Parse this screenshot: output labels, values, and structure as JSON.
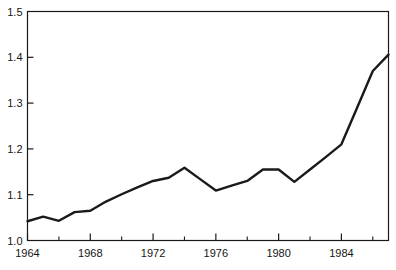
{
  "chart_data": {
    "type": "line",
    "title": "",
    "subtitle": "",
    "xlabel": "",
    "ylabel": "",
    "xlim": [
      1964,
      1987
    ],
    "ylim": [
      1.0,
      1.5
    ],
    "grid": false,
    "legend": false,
    "legend_position": "none",
    "x_major_ticks": [
      1964,
      1968,
      1972,
      1976,
      1980,
      1984
    ],
    "x_minor_ticks": [
      1966,
      1970,
      1974,
      1978,
      1982,
      1986
    ],
    "x_tick_labels": [
      "1964",
      "1968",
      "1972",
      "1976",
      "1980",
      "1984"
    ],
    "y_ticks": [
      1.0,
      1.1,
      1.2,
      1.3,
      1.4,
      1.5
    ],
    "y_tick_labels": [
      "1.0",
      "1.1",
      "1.2",
      "1.3",
      "1.4",
      "1.5"
    ],
    "line_color": "#1a1a1a",
    "line_width": 2.4,
    "frame_color": "#1a1a1a",
    "background_color": "#ffffff",
    "x": [
      1964,
      1965,
      1966,
      1967,
      1968,
      1969,
      1970,
      1971,
      1972,
      1973,
      1974,
      1975,
      1976,
      1977,
      1978,
      1979,
      1980,
      1981,
      1982,
      1983,
      1984,
      1985,
      1986,
      1987
    ],
    "values": [
      1.042,
      1.052,
      1.043,
      1.062,
      1.065,
      1.085,
      1.101,
      1.116,
      1.13,
      1.137,
      1.159,
      1.134,
      1.109,
      1.12,
      1.13,
      1.155,
      1.155,
      1.128,
      1.155,
      1.182,
      1.21,
      1.29,
      1.37,
      1.406
    ],
    "series": [
      {
        "name": "series-1",
        "values": [
          1.042,
          1.052,
          1.043,
          1.062,
          1.065,
          1.085,
          1.101,
          1.116,
          1.13,
          1.137,
          1.159,
          1.134,
          1.109,
          1.12,
          1.13,
          1.155,
          1.155,
          1.128,
          1.155,
          1.182,
          1.21,
          1.29,
          1.37,
          1.406
        ]
      }
    ]
  }
}
